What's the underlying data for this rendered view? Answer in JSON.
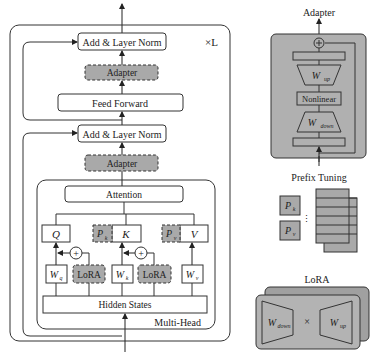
{
  "transformer": {
    "repeat_label": "×L",
    "add_norm_top": "Add & Layer Norm",
    "adapter_top": "Adapter",
    "feed_forward": "Feed Forward",
    "add_norm_bottom": "Add & Layer Norm",
    "adapter_bottom": "Adapter",
    "multi_head": {
      "label": "Multi-Head",
      "attention": "Attention",
      "q": "Q",
      "k": "K",
      "v": "V",
      "pk": "P",
      "pk_sub": "k",
      "pv": "P",
      "pv_sub": "v",
      "wq": "W",
      "wq_sub": "q",
      "wk": "W",
      "wk_sub": "k",
      "wv": "W",
      "wv_sub": "v",
      "lora_q": "LoRA",
      "lora_k": "LoRA",
      "hidden_states": "Hidden States",
      "plus": "+"
    }
  },
  "adapter_panel": {
    "title": "Adapter",
    "w_up": "W",
    "w_up_sub": "up",
    "nonlinear": "Nonlinear",
    "w_down": "W",
    "w_down_sub": "down"
  },
  "prefix_panel": {
    "title": "Prefix Tuning",
    "pk": "P",
    "pk_sub": "k",
    "pv": "P",
    "pv_sub": "v",
    "ellipsis": "⋮"
  },
  "lora_panel": {
    "title": "LoRA",
    "w_down": "W",
    "w_down_sub": "down",
    "times": "×",
    "w_up": "W",
    "w_up_sub": "up"
  },
  "colors": {
    "gray_fill": "#a9a9a9",
    "panel_fill": "#b0b0b0",
    "stroke": "#333333",
    "white": "#ffffff"
  }
}
